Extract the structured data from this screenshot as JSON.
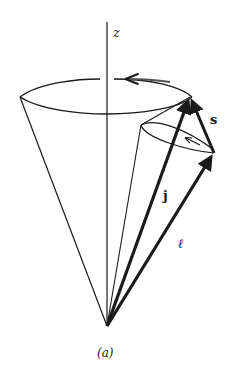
{
  "figure": {
    "caption": "(a)",
    "labels": {
      "z_axis": "z",
      "j_vector": "j",
      "s_vector": "s",
      "l_vector": "ℓ"
    },
    "colors": {
      "ink": "#1a1a1a",
      "background": "#ffffff"
    }
  }
}
